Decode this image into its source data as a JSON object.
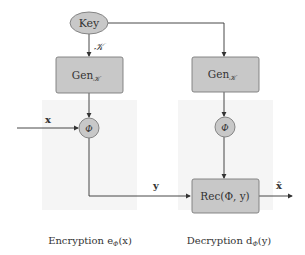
{
  "diagram": {
    "key_node": {
      "label": "Key"
    },
    "key_edge_label": "𝒦",
    "enc_gen": {
      "label": "Gen",
      "sub": "𝒦"
    },
    "dec_gen": {
      "label": "Gen",
      "sub": "𝒦"
    },
    "enc_phi": {
      "label": "Φ"
    },
    "dec_phi": {
      "label": "Φ"
    },
    "input_label": "x",
    "cipher_label": "y",
    "rec_node": {
      "label": "Rec(Φ, y)"
    },
    "output_label": "x̂",
    "captions": {
      "encryption": "Encryption e",
      "encryption_sub": "Φ",
      "encryption_arg": "(x)",
      "decryption": "Decryption d",
      "decryption_sub": "Φ",
      "decryption_arg": "(y)"
    },
    "colors": {
      "node_fill": "#c8c8c8",
      "node_stroke": "#7a7a7a",
      "edge": "#333333",
      "panel_shade": "#f4f4f4"
    }
  }
}
